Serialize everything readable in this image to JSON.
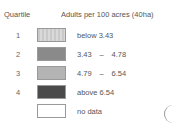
{
  "legend": {
    "header_quartile": "Quartile",
    "header_value": "Adults per 100 acres (40ha)",
    "rows": [
      {
        "quartile": "1",
        "label": "below 3.43",
        "color": "#d2d2d2",
        "pattern": "vertical-stripes"
      },
      {
        "quartile": "2",
        "from": "3.43",
        "sep": "–",
        "to": "4.78",
        "color": "#8a8a8a"
      },
      {
        "quartile": "3",
        "from": "4.79",
        "sep": "–",
        "to": "6.54",
        "color": "#b4b4b4"
      },
      {
        "quartile": "4",
        "label": "above 6.54",
        "color": "#4a4a4a"
      },
      {
        "quartile": "",
        "label": "no data",
        "color": "#ffffff"
      }
    ]
  }
}
